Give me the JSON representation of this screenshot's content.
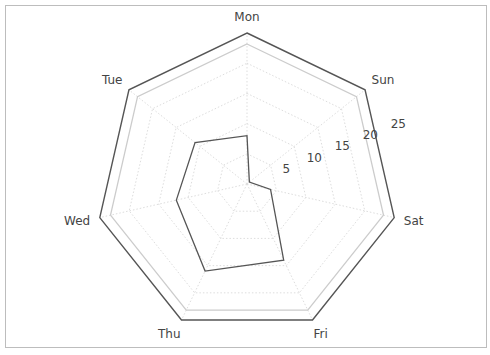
{
  "chart_data": {
    "type": "radar",
    "title": "",
    "categories": [
      "Mon",
      "Sun",
      "Sat",
      "Fri",
      "Thu",
      "Wed",
      "Tue"
    ],
    "series": [
      {
        "name": "",
        "values": [
          8,
          0.5,
          4,
          14,
          16,
          12,
          11
        ],
        "color": "#555555"
      }
    ],
    "radial_ticks": [
      5,
      10,
      15,
      20,
      25
    ],
    "rlim": [
      0,
      25
    ],
    "grid": true,
    "grid_shape": "polygon",
    "legend": null
  },
  "colors": {
    "frame": "#bdbdbd",
    "outer_polygon": "#555555",
    "inner_polygon": "#cccccc",
    "grid": "#dddddd",
    "series": "#555555",
    "text": "#444444"
  }
}
